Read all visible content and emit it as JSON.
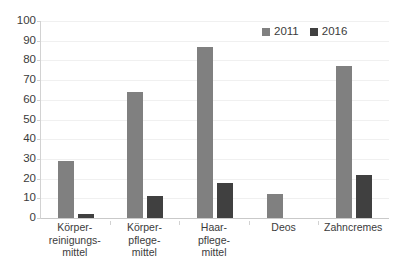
{
  "chart_data": {
    "type": "bar",
    "title": "",
    "subtitle": "",
    "xlabel": "",
    "ylabel": "",
    "ylim": [
      0,
      100
    ],
    "ytick_step": 10,
    "yticks": [
      0,
      10,
      20,
      30,
      40,
      50,
      60,
      70,
      80,
      90,
      100
    ],
    "grid": true,
    "grid_axis": "y",
    "legend_position": "top-right",
    "categories": [
      "Körper-\nreinigungs-\nmittel",
      "Körper-\npflege-\nmittel",
      "Haar-\npflege-\nmittel",
      "Deos",
      "Zahncremes"
    ],
    "series": [
      {
        "name": "2011",
        "color": "#808080",
        "values": [
          29,
          64,
          87,
          12,
          77
        ]
      },
      {
        "name": "2016",
        "color": "#404040",
        "values": [
          2,
          11,
          18,
          0,
          22
        ]
      }
    ]
  },
  "axis": {
    "y_labels": [
      "100",
      "90",
      "80",
      "70",
      "60",
      "50",
      "40",
      "30",
      "20",
      "10",
      "0"
    ],
    "x_labels": [
      {
        "lines": [
          "Körper-",
          "reinigungs-",
          "mittel"
        ]
      },
      {
        "lines": [
          "Körper-",
          "pflege-",
          "mittel"
        ]
      },
      {
        "lines": [
          "Haar-",
          "pflege-",
          "mittel"
        ]
      },
      {
        "lines": [
          "Deos"
        ]
      },
      {
        "lines": [
          "Zahncremes"
        ]
      }
    ]
  },
  "legend": {
    "entries": [
      {
        "label": "2011",
        "color": "#808080"
      },
      {
        "label": "2016",
        "color": "#404040"
      }
    ]
  },
  "colors": {
    "series_2011": "#808080",
    "series_2016": "#404040",
    "gridline": "#f0f0f0",
    "axis_line": "#d2d2d2",
    "text": "#3b3b3b",
    "background": "#ffffff"
  }
}
